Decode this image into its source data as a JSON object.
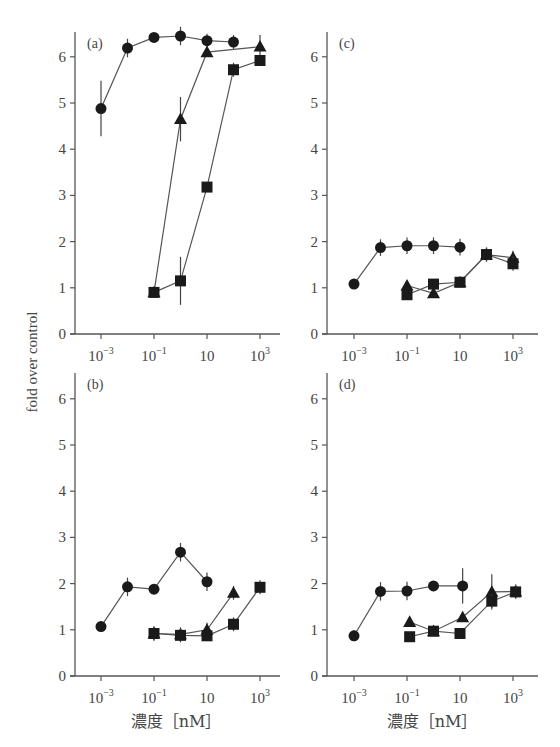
{
  "figure": {
    "ylabel": "fold over control",
    "xlabel": "濃度［nM］"
  },
  "chart_data": [
    {
      "type": "line",
      "panel": "(a)",
      "xscale": "log",
      "xlabel": "",
      "ylabel": "fold over control",
      "xticks": [
        "10^-3",
        "10^-1",
        "10",
        "10^3"
      ],
      "yticks": [
        0,
        1,
        2,
        3,
        4,
        5,
        6
      ],
      "ylim": [
        0,
        6.5
      ],
      "xlim_log10": [
        -4,
        3.7
      ],
      "series": [
        {
          "name": "circle",
          "marker": "circle",
          "x_log10": [
            -3,
            -2,
            -1,
            0,
            1,
            2
          ],
          "values": [
            4.88,
            6.19,
            6.42,
            6.45,
            6.35,
            6.32
          ],
          "err": [
            0.6,
            0.2,
            0.0,
            0.2,
            0.15,
            0.15
          ]
        },
        {
          "name": "triangle",
          "marker": "triangle",
          "x_log10": [
            -1,
            0,
            1,
            3
          ],
          "values": [
            0.9,
            4.65,
            6.1,
            6.22
          ],
          "err": [
            0.0,
            0.48,
            0.0,
            0.25
          ]
        },
        {
          "name": "square",
          "marker": "square",
          "x_log10": [
            -1,
            0,
            1,
            2,
            3
          ],
          "values": [
            0.9,
            1.15,
            3.18,
            5.72,
            5.92
          ],
          "err": [
            0.0,
            0.52,
            0.0,
            0.15,
            0.0
          ]
        }
      ]
    },
    {
      "type": "line",
      "panel": "(b)",
      "xscale": "log",
      "xlabel": "濃度［nM］",
      "ylabel": "fold over control",
      "xticks": [
        "10^-3",
        "10^-1",
        "10",
        "10^3"
      ],
      "yticks": [
        0,
        1,
        2,
        3,
        4,
        5,
        6
      ],
      "ylim": [
        0,
        6.5
      ],
      "xlim_log10": [
        -4,
        3.7
      ],
      "series": [
        {
          "name": "circle",
          "marker": "circle",
          "x_log10": [
            -3,
            -2,
            -1,
            0,
            1
          ],
          "values": [
            1.07,
            1.93,
            1.88,
            2.68,
            2.04
          ],
          "err": [
            0.0,
            0.2,
            0.0,
            0.2,
            0.2
          ]
        },
        {
          "name": "triangle",
          "marker": "triangle",
          "x_log10": [
            -1,
            0,
            1,
            2
          ],
          "values": [
            0.92,
            0.9,
            1.0,
            1.8
          ],
          "err": [
            0.15,
            0.15,
            0.15,
            0.15
          ]
        },
        {
          "name": "square",
          "marker": "square",
          "x_log10": [
            -1,
            0,
            1,
            2,
            3
          ],
          "values": [
            0.92,
            0.88,
            0.87,
            1.12,
            1.92
          ],
          "err": [
            0.15,
            0.15,
            0.0,
            0.15,
            0.15
          ]
        }
      ]
    },
    {
      "type": "line",
      "panel": "(c)",
      "xscale": "log",
      "xlabel": "",
      "ylabel": "",
      "xticks": [
        "10^-3",
        "10^-1",
        "10",
        "10^3"
      ],
      "yticks": [
        0,
        1,
        2,
        3,
        4,
        5,
        6
      ],
      "ylim": [
        0,
        6.5
      ],
      "xlim_log10": [
        -4,
        3.7
      ],
      "series": [
        {
          "name": "circle",
          "marker": "circle",
          "x_log10": [
            -3,
            -2,
            -1,
            0,
            1
          ],
          "values": [
            1.08,
            1.87,
            1.91,
            1.91,
            1.88
          ],
          "err": [
            0.0,
            0.18,
            0.18,
            0.18,
            0.18
          ]
        },
        {
          "name": "triangle",
          "marker": "triangle",
          "x_log10": [
            -1,
            0,
            1,
            2,
            3
          ],
          "values": [
            1.05,
            0.88,
            1.12,
            1.72,
            1.65
          ],
          "err": [
            0.0,
            0.0,
            0.0,
            0.15,
            0.15
          ]
        },
        {
          "name": "square",
          "marker": "square",
          "x_log10": [
            -1,
            0,
            1,
            2,
            3
          ],
          "values": [
            0.85,
            1.08,
            1.12,
            1.72,
            1.52
          ],
          "err": [
            0.0,
            0.0,
            0.0,
            0.15,
            0.15
          ]
        }
      ]
    },
    {
      "type": "line",
      "panel": "(d)",
      "xscale": "log",
      "xlabel": "濃度［nM］",
      "ylabel": "",
      "xticks": [
        "10^-3",
        "10^-1",
        "10",
        "10^3"
      ],
      "yticks": [
        0,
        1,
        2,
        3,
        4,
        5,
        6
      ],
      "ylim": [
        0,
        6.5
      ],
      "xlim_log10": [
        -4,
        3.7
      ],
      "series": [
        {
          "name": "circle",
          "marker": "circle",
          "x_log10": [
            -3,
            -2,
            -1,
            0,
            1.1
          ],
          "values": [
            0.87,
            1.83,
            1.84,
            1.95,
            1.95
          ],
          "err": [
            0.12,
            0.2,
            0.2,
            0.0,
            0.38
          ]
        },
        {
          "name": "triangle",
          "marker": "triangle",
          "x_log10": [
            -0.9,
            0,
            1.1,
            2.2,
            3.1
          ],
          "values": [
            1.17,
            0.97,
            1.27,
            1.82,
            1.83
          ],
          "err": [
            0.0,
            0.0,
            0.0,
            0.38,
            0.15
          ]
        },
        {
          "name": "square",
          "marker": "square",
          "x_log10": [
            -0.9,
            0,
            1,
            2.2,
            3.1
          ],
          "values": [
            0.85,
            0.97,
            0.92,
            1.62,
            1.82
          ],
          "err": [
            0.0,
            0.0,
            0.0,
            0.15,
            0.15
          ]
        }
      ]
    }
  ],
  "layout": {
    "panels": [
      {
        "x_origin": 75,
        "x_end": 280,
        "y_zero": 334,
        "y_top": 32,
        "x_at_log_minus3": 101
      },
      {
        "x_origin": 75,
        "x_end": 280,
        "y_zero": 676,
        "y_top": 373,
        "x_at_log_minus3": 101
      },
      {
        "x_origin": 327,
        "x_end": 538,
        "y_zero": 334,
        "y_top": 32,
        "x_at_log_minus3": 354
      },
      {
        "x_origin": 327,
        "x_end": 538,
        "y_zero": 676,
        "y_top": 373,
        "x_at_log_minus3": 354
      }
    ],
    "px_per_decade": 26.5,
    "px_per_unit": 46.2
  }
}
